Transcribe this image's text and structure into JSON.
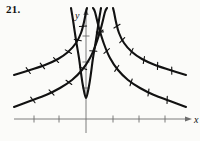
{
  "figure": {
    "number_label": "21.",
    "axis_x_label": "x",
    "axis_y_label": "y",
    "caption": ""
  },
  "colors": {
    "curve": "#111111",
    "axis": "#6d6d6d",
    "background": "#fbfbf9",
    "text": "#111111"
  },
  "chart_data": {
    "type": "line",
    "title": "",
    "xlabel": "x",
    "ylabel": "y",
    "grid": false,
    "legend": null,
    "axes": {
      "origin_px": [
        86,
        119
      ],
      "x_axis_y_px": 119,
      "y_axis_x_px": 86,
      "x_tick_px": [
        34,
        59,
        113,
        139,
        165
      ],
      "y_tick_px": [
        36,
        62,
        88
      ],
      "x_arrow_end_px": 186,
      "y_arrow_end_px": 14,
      "xlim_px": [
        14,
        190
      ],
      "ylim_px": [
        8,
        133
      ]
    },
    "series": [
      {
        "name": "central-u-curve",
        "hash_marks": false,
        "points_px": [
          [
            71,
            8
          ],
          [
            73,
            20
          ],
          [
            76,
            40
          ],
          [
            79,
            58
          ],
          [
            81,
            73
          ],
          [
            83,
            86
          ],
          [
            86,
            98
          ],
          [
            89,
            86
          ],
          [
            91,
            73
          ],
          [
            93,
            58
          ],
          [
            96,
            40
          ],
          [
            99,
            20
          ],
          [
            101,
            8
          ]
        ]
      },
      {
        "name": "family-a-left-branch",
        "hash_marks": true,
        "points_px": [
          [
            14,
            107
          ],
          [
            30,
            101
          ],
          [
            46,
            95
          ],
          [
            60,
            88
          ],
          [
            72,
            80
          ],
          [
            82,
            70
          ],
          [
            90,
            58
          ],
          [
            96,
            44
          ],
          [
            101,
            28
          ],
          [
            105,
            12
          ],
          [
            107,
            8
          ]
        ]
      },
      {
        "name": "family-a-right-branch",
        "hash_marks": true,
        "points_px": [
          [
            186,
            107
          ],
          [
            170,
            101
          ],
          [
            154,
            95
          ],
          [
            140,
            88
          ],
          [
            128,
            80
          ],
          [
            118,
            70
          ],
          [
            110,
            58
          ],
          [
            104,
            44
          ],
          [
            99,
            28
          ],
          [
            95,
            12
          ],
          [
            93,
            8
          ]
        ]
      },
      {
        "name": "family-b-left-branch",
        "hash_marks": true,
        "points_px": [
          [
            14,
            75
          ],
          [
            30,
            70
          ],
          [
            45,
            65
          ],
          [
            58,
            59
          ],
          [
            68,
            52
          ],
          [
            76,
            43
          ],
          [
            81,
            33
          ],
          [
            84,
            22
          ],
          [
            86,
            12
          ],
          [
            87,
            8
          ]
        ]
      },
      {
        "name": "family-b-right-branch",
        "hash_marks": true,
        "points_px": [
          [
            186,
            75
          ],
          [
            170,
            70
          ],
          [
            155,
            65
          ],
          [
            142,
            59
          ],
          [
            132,
            52
          ],
          [
            124,
            43
          ],
          [
            119,
            33
          ],
          [
            116,
            22
          ],
          [
            114,
            12
          ],
          [
            113,
            8
          ]
        ]
      }
    ],
    "hash_mark_count_per_branch": 6
  }
}
